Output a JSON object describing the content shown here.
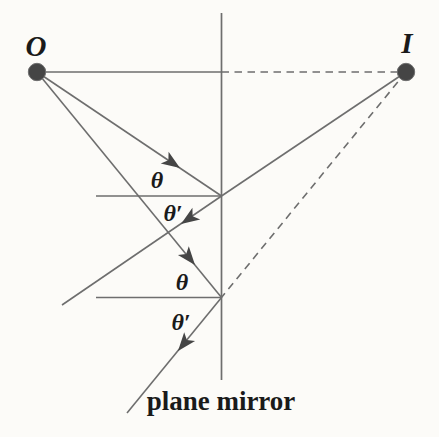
{
  "figure": {
    "caption": "plane mirror",
    "labels": {
      "object": "O",
      "image": "I",
      "theta_incident_1": "θ",
      "theta_reflected_1": "θ′",
      "theta_incident_2": "θ",
      "theta_reflected_2": "θ′"
    },
    "colors": {
      "background": "#fcfbf8",
      "line": "#6e6e6e",
      "marker": "#454545",
      "text": "#1a1a1a"
    },
    "points": {
      "object": {
        "x": 37,
        "y": 72
      },
      "image": {
        "x": 406,
        "y": 72
      },
      "reflection_1": {
        "x": 221.5,
        "y": 196
      },
      "reflection_2": {
        "x": 221.5,
        "y": 297.5
      }
    },
    "lines": [
      {
        "name": "mirror-line",
        "x1": 221.5,
        "y1": 13,
        "x2": 221.5,
        "y2": 380,
        "dashed": false,
        "w": 1.7
      },
      {
        "name": "object-axis-solid",
        "x1": 37,
        "y1": 72,
        "x2": 221.5,
        "y2": 72,
        "dashed": false,
        "w": 1.6
      },
      {
        "name": "axis-to-image-dashed",
        "x1": 221.5,
        "y1": 72,
        "x2": 406,
        "y2": 72,
        "dashed": true,
        "w": 1.6
      },
      {
        "name": "incident-ray-1",
        "x1": 37,
        "y1": 72,
        "x2": 221.5,
        "y2": 196,
        "dashed": false,
        "w": 1.6
      },
      {
        "name": "reflected-ray-1",
        "x1": 221.5,
        "y1": 196,
        "x2": 62,
        "y2": 305,
        "dashed": false,
        "w": 1.6
      },
      {
        "name": "extension-ray-1-to-image",
        "x1": 221.5,
        "y1": 196,
        "x2": 406,
        "y2": 72,
        "dashed": false,
        "w": 1.6
      },
      {
        "name": "incident-ray-2",
        "x1": 37,
        "y1": 72,
        "x2": 221.5,
        "y2": 297.5,
        "dashed": false,
        "w": 1.6
      },
      {
        "name": "reflected-ray-2",
        "x1": 221.5,
        "y1": 297.5,
        "x2": 127,
        "y2": 413,
        "dashed": false,
        "w": 1.6
      },
      {
        "name": "extension-ray-2-to-image-dashed",
        "x1": 406,
        "y1": 72,
        "x2": 221.5,
        "y2": 297.5,
        "dashed": true,
        "w": 1.6
      },
      {
        "name": "normal-1",
        "x1": 96,
        "y1": 196,
        "x2": 221.5,
        "y2": 196,
        "dashed": false,
        "w": 1.5
      },
      {
        "name": "normal-2",
        "x1": 96,
        "y1": 297.5,
        "x2": 221.5,
        "y2": 297.5,
        "dashed": false,
        "w": 1.5
      }
    ],
    "arrows": [
      {
        "name": "incident-ray-1-arrowhead",
        "x": 180,
        "y": 168,
        "angle": 34
      },
      {
        "name": "reflected-ray-1-arrowhead",
        "x": 181,
        "y": 224,
        "angle": 146
      },
      {
        "name": "incident-ray-2-arrowhead",
        "x": 195,
        "y": 265,
        "angle": 51
      },
      {
        "name": "reflected-ray-2-arrowhead",
        "x": 178,
        "y": 351,
        "angle": 129
      }
    ],
    "dots": [
      {
        "name": "object-dot",
        "x": 37,
        "y": 72,
        "r": 8.7
      },
      {
        "name": "image-dot",
        "x": 406,
        "y": 72,
        "r": 8.7
      }
    ]
  }
}
